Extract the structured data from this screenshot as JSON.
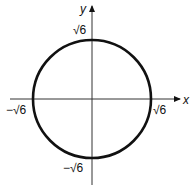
{
  "diagram": {
    "type": "circle-on-axes",
    "equation_implied": "x^2 + y^2 = 6",
    "center": [
      0,
      0
    ],
    "radius_label": "√6",
    "axes": {
      "x_label": "x",
      "y_label": "y"
    },
    "intercepts": {
      "top": "√6",
      "bottom": "−√6",
      "left": "−√6",
      "right": "√6"
    },
    "colors": {
      "stroke": "#111111",
      "background": "#ffffff"
    }
  }
}
